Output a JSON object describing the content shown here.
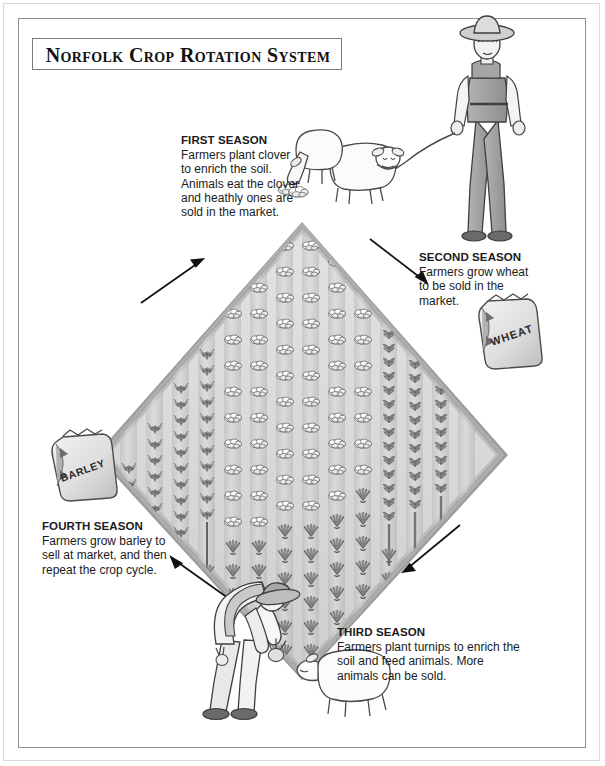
{
  "title": "Norfolk Crop Rotation System",
  "seasons": [
    {
      "id": "first",
      "heading": "FIRST SEASON",
      "body": "Farmers plant clover to enrich the soil. Animals eat the clover and heathly ones are sold in the market."
    },
    {
      "id": "second",
      "heading": "SECOND SEASON",
      "body": "Farmers grow wheat to be sold in the market."
    },
    {
      "id": "third",
      "heading": "THIRD SEASON",
      "body": "Farmers plant turnips to enrich the soil and feed animals. More animals can be sold."
    },
    {
      "id": "fourth",
      "heading": "FOURTH SEASON",
      "body": "Farmers grow barley to sell at market, and then repeat the crop cycle."
    }
  ],
  "sacks": [
    {
      "id": "wheat-sack",
      "label": "WHEAT"
    },
    {
      "id": "barley-sack",
      "label": "BARLEY"
    }
  ],
  "figures": [
    {
      "id": "standing-farmer",
      "name": "farmer-with-leashed-sheep"
    },
    {
      "id": "grazing-sheep",
      "name": "sheep-eating-clover"
    },
    {
      "id": "leashed-sheep",
      "name": "sheep-on-leash"
    },
    {
      "id": "bending-farmer",
      "name": "farmer-feeding-turnips"
    },
    {
      "id": "fed-sheep",
      "name": "sheep-being-fed"
    }
  ],
  "field": {
    "name": "rotation-field-diamond",
    "quadrants": [
      {
        "id": "clover",
        "crop": "clover"
      },
      {
        "id": "wheat",
        "crop": "wheat"
      },
      {
        "id": "turnips",
        "crop": "turnips"
      },
      {
        "id": "barley",
        "crop": "barley"
      }
    ]
  },
  "arrows": [
    {
      "id": "arrow-to-first",
      "direction": "up-right"
    },
    {
      "id": "arrow-to-second",
      "direction": "down-right"
    },
    {
      "id": "arrow-to-third",
      "direction": "down-left"
    },
    {
      "id": "arrow-to-fourth",
      "direction": "up-left"
    }
  ],
  "colors": {
    "field_fill": "#d8d8d8",
    "field_edge": "#8f8f8f",
    "crop_dark": "#6f6f6f",
    "crop_light": "#efefef",
    "ink": "#1b1b1b",
    "frame": "#8d8d8d"
  }
}
